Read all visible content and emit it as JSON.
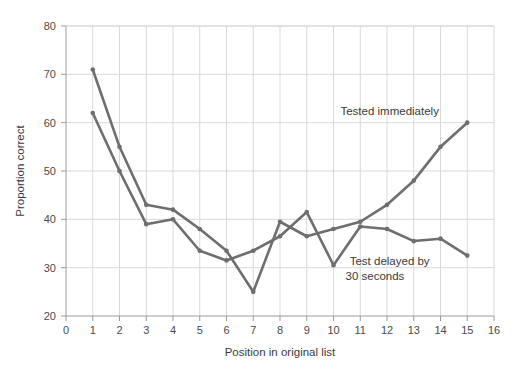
{
  "chart_data": {
    "type": "line",
    "title": "",
    "subtitle": "",
    "xlabel": "Position in original list",
    "ylabel": "Proportion correct",
    "xlim": [
      0,
      16
    ],
    "ylim": [
      20,
      80
    ],
    "xticks": [
      0,
      1,
      2,
      3,
      4,
      5,
      6,
      7,
      8,
      9,
      10,
      11,
      12,
      13,
      14,
      15,
      16
    ],
    "yticks": [
      20,
      30,
      40,
      50,
      60,
      70,
      80
    ],
    "xtick_labels": [
      "0",
      "1",
      "2",
      "3",
      "4",
      "5",
      "6",
      "7",
      "8",
      "9",
      "10",
      "11",
      "12",
      "13",
      "14",
      "15",
      "16"
    ],
    "ytick_labels": [
      "20",
      "30",
      "40",
      "50",
      "60",
      "70",
      "80"
    ],
    "grid": true,
    "grid_color": "#d9d9d9",
    "legend_position": "inline-annotation",
    "x": [
      1,
      2,
      3,
      4,
      5,
      6,
      7,
      8,
      9,
      10,
      11,
      12,
      13,
      14,
      15
    ],
    "series": [
      {
        "name": "Tested immediately",
        "color": "#6e6e6e",
        "values": [
          71,
          55,
          43,
          42,
          38,
          33.5,
          25,
          39.5,
          36.5,
          38,
          39.5,
          43,
          48,
          55,
          60
        ]
      },
      {
        "name": "Test delayed by 30 seconds",
        "color": "#6e6e6e",
        "values": [
          62,
          50,
          39,
          40,
          33.5,
          31.5,
          33.5,
          36.5,
          41.5,
          30.5,
          38.5,
          38,
          35.5,
          36,
          32.5
        ]
      }
    ],
    "annotations": [
      {
        "text": "Tested immediately",
        "x": 12.1,
        "y": 61.5,
        "anchor": "middle"
      },
      {
        "text": "Test delayed by",
        "x": 12.1,
        "y": 30.5,
        "anchor": "middle"
      },
      {
        "text": "30 seconds",
        "x": 11.55,
        "y": 27.4,
        "anchor": "middle"
      }
    ]
  },
  "axes": {
    "x_title": "Position in original list",
    "y_title": "Proportion correct"
  },
  "annotations": {
    "series1_label": "Tested immediately",
    "series2_label_line1": "Test delayed by",
    "series2_label_line2": "30 seconds"
  },
  "colors": {
    "line": "#6e6e6e",
    "grid": "#d9d9d9",
    "axis": "#9a9a9a",
    "text": "#3a3a3a",
    "background": "#ffffff"
  }
}
